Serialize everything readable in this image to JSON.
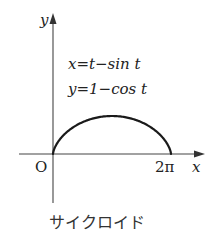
{
  "figure": {
    "caption": "サイクロイド",
    "axes": {
      "x_label": "x",
      "y_label": "y",
      "origin_label": "O",
      "x_tick_label": "2π"
    },
    "equations": {
      "line1": "x=t−sin t",
      "line2": "y=1−cos t"
    },
    "colors": {
      "axis": "#444444",
      "curve": "#1a1a1a",
      "text": "#222222",
      "background": "#ffffff"
    }
  },
  "chart_data": {
    "type": "line",
    "title": "サイクロイド",
    "xlabel": "x",
    "ylabel": "y",
    "parametric": {
      "x": "t - sin t",
      "y": "1 - cos t",
      "t_range": [
        0,
        6.2832
      ]
    },
    "x_ticks": [
      "O",
      "2π"
    ],
    "xlim": [
      0,
      6.2832
    ],
    "ylim": [
      0,
      2
    ],
    "grid": false,
    "legend": "none",
    "series": [
      {
        "name": "cycloid",
        "x": [
          0,
          0.0783,
          0.5708,
          1.7854,
          3.1416,
          4.4978,
          5.7124,
          6.2049,
          6.2832
        ],
        "y": [
          0,
          0.4596,
          1.0,
          1.7071,
          2.0,
          1.7071,
          1.0,
          0.4596,
          0
        ]
      }
    ]
  }
}
